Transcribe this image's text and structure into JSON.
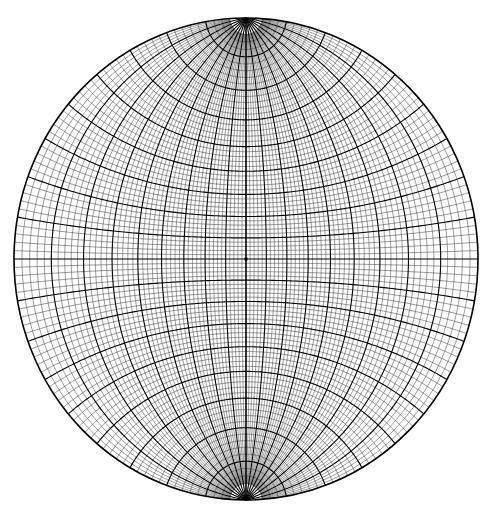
{
  "diagram": {
    "type": "wulff-stereonet",
    "center": [
      246,
      259
    ],
    "radius_x": 232,
    "radius_y": 241,
    "minor_interval_deg": 2,
    "major_interval_deg": 10,
    "pole_cap_deg": 4,
    "colors": {
      "line": "#000000",
      "background": "#ffffff"
    }
  }
}
